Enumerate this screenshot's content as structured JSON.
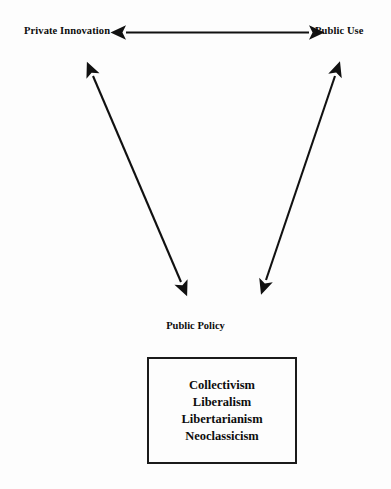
{
  "diagram": {
    "background_color": "#fdfdfd",
    "stroke_color": "#111111",
    "axis": {
      "left_label": "Private Innovation",
      "right_label": "Public Use",
      "connector_icon": "double-headed-horizontal-arrow"
    },
    "converging_arrows": {
      "left_icon": "double-headed-diagonal-arrow",
      "right_icon": "double-headed-diagonal-arrow"
    },
    "policy": {
      "heading": "Public Policy",
      "items": [
        "Collectivism",
        "Liberalism",
        "Libertarianism",
        "Neoclassicism"
      ]
    }
  }
}
